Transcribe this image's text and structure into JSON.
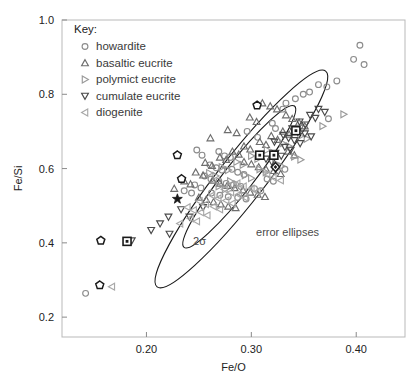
{
  "figure": {
    "background": "#ffffff",
    "frame_color": "#b9b9b9",
    "ellipse_color": "#1a1a1a"
  },
  "key": {
    "title": "Key:",
    "items": [
      {
        "label": "howardite",
        "marker": "circle",
        "color": "#8c8c8c"
      },
      {
        "label": "basaltic eucrite",
        "marker": "triangle-up",
        "color": "#6e6e6e"
      },
      {
        "label": "polymict eucrite",
        "marker": "triangle-right",
        "color": "#9a9a9a"
      },
      {
        "label": "cumulate eucrite",
        "marker": "triangle-down",
        "color": "#4a4a4a"
      },
      {
        "label": "diogenite",
        "marker": "triangle-left",
        "color": "#a8a8a8"
      }
    ]
  },
  "annotations": [
    {
      "text": "2σ",
      "x": 0.2445,
      "y": 0.395
    },
    {
      "text": "error ellipses",
      "x": 0.3045,
      "y": 0.418
    }
  ],
  "chart_data": {
    "type": "scatter",
    "title": "",
    "xlabel": "Fe/O",
    "ylabel": "Fe/Si",
    "xlim": [
      0.1195,
      0.4465
    ],
    "ylim": [
      0.1465,
      1.0
    ],
    "xticks": [
      0.2,
      0.3,
      0.4
    ],
    "xticklabels": [
      "0.20",
      "0.30",
      "0.40"
    ],
    "yticks": [
      0.2,
      0.4,
      0.6,
      0.8,
      1.0
    ],
    "yticklabels": [
      "0.2",
      "0.4",
      "0.6",
      "0.8",
      "1.0"
    ],
    "grid": false,
    "legend_position": "upper-left",
    "ellipses": [
      {
        "name": "inner-2sigma",
        "cx": 0.2885,
        "cy": 0.578,
        "rx": 0.0855,
        "ry": 0.0395,
        "angle_deg": -52
      },
      {
        "name": "outer-2sigma",
        "cx": 0.2905,
        "cy": 0.572,
        "rx": 0.1305,
        "ry": 0.0625,
        "angle_deg": -52
      }
    ],
    "series": [
      {
        "name": "howardite",
        "marker": "circle",
        "color": "#8c8c8c",
        "points": [
          [
            0.4035,
            0.932
          ],
          [
            0.3975,
            0.894
          ],
          [
            0.4075,
            0.88
          ],
          [
            0.3815,
            0.836
          ],
          [
            0.364,
            0.826
          ],
          [
            0.372,
            0.82
          ],
          [
            0.3555,
            0.806
          ],
          [
            0.3495,
            0.8
          ],
          [
            0.342,
            0.788
          ],
          [
            0.333,
            0.776
          ],
          [
            0.33,
            0.76
          ],
          [
            0.3735,
            0.734
          ],
          [
            0.32,
            0.722
          ],
          [
            0.323,
            0.708
          ],
          [
            0.296,
            0.7
          ],
          [
            0.306,
            0.684
          ],
          [
            0.248,
            0.65
          ],
          [
            0.253,
            0.636
          ],
          [
            0.269,
            0.646
          ],
          [
            0.2745,
            0.634
          ],
          [
            0.28,
            0.63
          ],
          [
            0.2605,
            0.61
          ],
          [
            0.2665,
            0.602
          ],
          [
            0.272,
            0.596
          ],
          [
            0.2815,
            0.598
          ],
          [
            0.287,
            0.59
          ],
          [
            0.293,
            0.584
          ],
          [
            0.2555,
            0.58
          ],
          [
            0.2615,
            0.572
          ],
          [
            0.269,
            0.566
          ],
          [
            0.276,
            0.56
          ],
          [
            0.283,
            0.556
          ],
          [
            0.29,
            0.552
          ],
          [
            0.246,
            0.556
          ],
          [
            0.252,
            0.548
          ],
          [
            0.236,
            0.54
          ],
          [
            0.243,
            0.534
          ],
          [
            0.262,
            0.534
          ],
          [
            0.27,
            0.528
          ],
          [
            0.278,
            0.524
          ],
          [
            0.287,
            0.522
          ],
          [
            0.295,
            0.518
          ],
          [
            0.303,
            0.546
          ],
          [
            0.309,
            0.54
          ],
          [
            0.315,
            0.572
          ],
          [
            0.321,
            0.566
          ],
          [
            0.332,
            0.598
          ],
          [
            0.142,
            0.264
          ]
        ]
      },
      {
        "name": "basaltic eucrite",
        "marker": "triangle-up",
        "color": "#6e6e6e",
        "points": [
          [
            0.3105,
            0.776
          ],
          [
            0.318,
            0.768
          ],
          [
            0.3245,
            0.76
          ],
          [
            0.333,
            0.744
          ],
          [
            0.339,
            0.734
          ],
          [
            0.2985,
            0.738
          ],
          [
            0.305,
            0.726
          ],
          [
            0.2775,
            0.704
          ],
          [
            0.286,
            0.696
          ],
          [
            0.261,
            0.682
          ],
          [
            0.3455,
            0.724
          ],
          [
            0.351,
            0.714
          ],
          [
            0.33,
            0.7
          ],
          [
            0.336,
            0.692
          ],
          [
            0.319,
            0.688
          ],
          [
            0.325,
            0.678
          ],
          [
            0.308,
            0.672
          ],
          [
            0.314,
            0.664
          ],
          [
            0.293,
            0.66
          ],
          [
            0.299,
            0.652
          ],
          [
            0.282,
            0.646
          ],
          [
            0.288,
            0.638
          ],
          [
            0.27,
            0.63
          ],
          [
            0.276,
            0.624
          ],
          [
            0.256,
            0.616
          ],
          [
            0.2625,
            0.608
          ],
          [
            0.293,
            0.618
          ],
          [
            0.3,
            0.612
          ],
          [
            0.307,
            0.604
          ],
          [
            0.314,
            0.598
          ],
          [
            0.3215,
            0.594
          ],
          [
            0.328,
            0.586
          ],
          [
            0.335,
            0.646
          ],
          [
            0.341,
            0.636
          ],
          [
            0.247,
            0.59
          ],
          [
            0.254,
            0.582
          ],
          [
            0.236,
            0.566
          ],
          [
            0.242,
            0.558
          ],
          [
            0.2265,
            0.546
          ],
          [
            0.263,
            0.568
          ],
          [
            0.27,
            0.56
          ],
          [
            0.277,
            0.554
          ],
          [
            0.284,
            0.548
          ],
          [
            0.292,
            0.542
          ],
          [
            0.299,
            0.536
          ],
          [
            0.306,
            0.53
          ],
          [
            0.313,
            0.524
          ],
          [
            0.25,
            0.522
          ],
          [
            0.257,
            0.516
          ],
          [
            0.264,
            0.51
          ],
          [
            0.271,
            0.504
          ],
          [
            0.278,
            0.498
          ],
          [
            0.285,
            0.494
          ]
        ]
      },
      {
        "name": "polymict eucrite",
        "marker": "triangle-right",
        "color": "#9a9a9a",
        "points": [
          [
            0.388,
            0.746
          ],
          [
            0.368,
            0.714
          ],
          [
            0.347,
            0.688
          ],
          [
            0.353,
            0.68
          ],
          [
            0.33,
            0.668
          ],
          [
            0.336,
            0.66
          ],
          [
            0.315,
            0.65
          ],
          [
            0.321,
            0.642
          ],
          [
            0.3,
            0.634
          ],
          [
            0.306,
            0.626
          ],
          [
            0.286,
            0.618
          ],
          [
            0.292,
            0.61
          ],
          [
            0.272,
            0.604
          ],
          [
            0.278,
            0.596
          ],
          [
            0.26,
            0.588
          ],
          [
            0.266,
            0.58
          ],
          [
            0.341,
            0.632
          ],
          [
            0.347,
            0.624
          ],
          [
            0.323,
            0.614
          ],
          [
            0.329,
            0.606
          ],
          [
            0.308,
            0.598
          ],
          [
            0.314,
            0.59
          ],
          [
            0.294,
            0.582
          ],
          [
            0.3,
            0.574
          ],
          [
            0.28,
            0.566
          ],
          [
            0.286,
            0.558
          ],
          [
            0.269,
            0.552
          ],
          [
            0.275,
            0.544
          ]
        ]
      },
      {
        "name": "cumulate eucrite",
        "marker": "triangle-down",
        "color": "#4a4a4a",
        "points": [
          [
            0.364,
            0.76
          ],
          [
            0.37,
            0.752
          ],
          [
            0.356,
            0.744
          ],
          [
            0.361,
            0.736
          ],
          [
            0.346,
            0.726
          ],
          [
            0.3515,
            0.718
          ],
          [
            0.339,
            0.708
          ],
          [
            0.344,
            0.7
          ],
          [
            0.3305,
            0.69
          ],
          [
            0.3355,
            0.682
          ],
          [
            0.322,
            0.672
          ],
          [
            0.351,
            0.694
          ],
          [
            0.357,
            0.686
          ],
          [
            0.341,
            0.676
          ],
          [
            0.3465,
            0.668
          ],
          [
            0.332,
            0.658
          ],
          [
            0.3375,
            0.65
          ],
          [
            0.323,
            0.642
          ],
          [
            0.3285,
            0.634
          ],
          [
            0.314,
            0.626
          ],
          [
            0.3195,
            0.618
          ],
          [
            0.233,
            0.49
          ],
          [
            0.221,
            0.47
          ],
          [
            0.213,
            0.452
          ],
          [
            0.2045,
            0.434
          ],
          [
            0.241,
            0.47
          ],
          [
            0.254,
            0.496
          ],
          [
            0.186,
            0.406
          ],
          [
            0.222,
            0.424
          ]
        ]
      },
      {
        "name": "diogenite",
        "marker": "triangle-left",
        "color": "#a8a8a8",
        "points": [
          [
            0.2865,
            0.56
          ],
          [
            0.2925,
            0.552
          ],
          [
            0.2745,
            0.544
          ],
          [
            0.2805,
            0.536
          ],
          [
            0.2625,
            0.528
          ],
          [
            0.2685,
            0.52
          ],
          [
            0.2505,
            0.512
          ],
          [
            0.2565,
            0.504
          ],
          [
            0.239,
            0.496
          ],
          [
            0.245,
            0.488
          ],
          [
            0.3,
            0.546
          ],
          [
            0.306,
            0.538
          ],
          [
            0.288,
            0.53
          ],
          [
            0.294,
            0.522
          ],
          [
            0.276,
            0.514
          ],
          [
            0.282,
            0.506
          ],
          [
            0.264,
            0.498
          ],
          [
            0.27,
            0.49
          ],
          [
            0.252,
            0.482
          ],
          [
            0.258,
            0.474
          ],
          [
            0.242,
            0.466
          ],
          [
            0.248,
            0.458
          ],
          [
            0.232,
            0.452
          ],
          [
            0.315,
            0.584
          ],
          [
            0.321,
            0.576
          ],
          [
            0.328,
            0.568
          ],
          [
            0.167,
            0.282
          ]
        ]
      },
      {
        "name": "special-square",
        "marker": "square",
        "color": "#1a1a1a",
        "points": [
          [
            0.308,
            0.636
          ],
          [
            0.3215,
            0.636
          ],
          [
            0.1815,
            0.404
          ],
          [
            0.3425,
            0.702
          ]
        ]
      },
      {
        "name": "special-pentagon",
        "marker": "pentagon",
        "color": "#1a1a1a",
        "points": [
          [
            0.1555,
            0.286
          ],
          [
            0.1565,
            0.406
          ],
          [
            0.2335,
            0.572
          ],
          [
            0.2295,
            0.636
          ],
          [
            0.3055,
            0.77
          ]
        ]
      },
      {
        "name": "special-diamond",
        "marker": "diamond",
        "color": "#1a1a1a",
        "points": [
          [
            0.323,
            0.604
          ]
        ]
      },
      {
        "name": "special-star",
        "marker": "star",
        "color": "#1a1a1a",
        "points": [
          [
            0.2295,
            0.518
          ]
        ]
      }
    ]
  }
}
